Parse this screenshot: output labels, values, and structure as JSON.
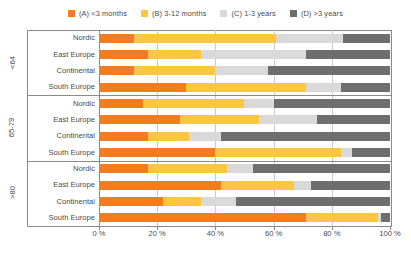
{
  "chart_data": {
    "type": "bar",
    "orientation": "horizontal",
    "stacked": true,
    "stack_unit": "percent",
    "title": "",
    "xlabel": "",
    "ylabel": "",
    "xlim": [
      0,
      100
    ],
    "grid": true,
    "legend_position": "top",
    "xtick_labels": [
      "0 %",
      "20 %",
      "40 %",
      "60 %",
      "80 %",
      "100 %"
    ],
    "xtick_values": [
      0,
      20,
      40,
      60,
      80,
      100
    ],
    "legend": [
      {
        "key": "A",
        "label": "(A) <3 months",
        "color": "#F47C20"
      },
      {
        "key": "B",
        "label": "(B) 3-12 months",
        "color": "#FBC740"
      },
      {
        "key": "C",
        "label": "(C) 1-3 years",
        "color": "#D9D9D9"
      },
      {
        "key": "D",
        "label": "(D) >3 years",
        "color": "#6E6E6E"
      }
    ],
    "series": [
      {
        "name": "(A) <3 months",
        "color": "#F47C20"
      },
      {
        "name": "(B) 3-12 months",
        "color": "#FBC740"
      },
      {
        "name": "(C) 1-3 years",
        "color": "#D9D9D9"
      },
      {
        "name": "(D) >3 years",
        "color": "#6E6E6E"
      }
    ],
    "groups": [
      {
        "label": "<64",
        "rows": [
          {
            "category": "Nordic",
            "values": [
              12,
              49,
              23,
              16
            ]
          },
          {
            "category": "East Europe",
            "values": [
              17,
              18,
              36,
              29
            ]
          },
          {
            "category": "Continental",
            "values": [
              12,
              28,
              18,
              42
            ]
          },
          {
            "category": "South Europe",
            "values": [
              30,
              41,
              12,
              17
            ]
          }
        ]
      },
      {
        "label": "65-79",
        "rows": [
          {
            "category": "Nordic",
            "values": [
              15,
              35,
              10,
              40
            ]
          },
          {
            "category": "East Europe",
            "values": [
              28,
              27,
              20,
              25
            ]
          },
          {
            "category": "Continental",
            "values": [
              17,
              14,
              11,
              58
            ]
          },
          {
            "category": "South Europe",
            "values": [
              40,
              43,
              4,
              13
            ]
          }
        ]
      },
      {
        "label": ">80",
        "rows": [
          {
            "category": "Nordic",
            "values": [
              17,
              27,
              9,
              47
            ]
          },
          {
            "category": "East Europe",
            "values": [
              42,
              25,
              6,
              27
            ]
          },
          {
            "category": "Continental",
            "values": [
              22,
              13,
              12,
              53
            ]
          },
          {
            "category": "South Europe",
            "values": [
              71,
              25,
              1,
              3
            ]
          }
        ]
      }
    ]
  }
}
